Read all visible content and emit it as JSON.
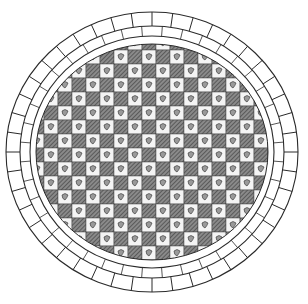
{
  "figure": {
    "background": "#ffffff",
    "ink": "#2a2a2a",
    "dark_cell": "#6b6b6b",
    "light_cell": "#f4f4f4",
    "outer_ring_cells": 44,
    "inner_ring_cells": 40,
    "center": [
      150,
      150
    ],
    "outer_radius": [
      142,
      145
    ],
    "inner_radius": [
      122,
      124
    ],
    "core_radius": [
      112,
      114
    ],
    "grid_cell_size": 14
  }
}
